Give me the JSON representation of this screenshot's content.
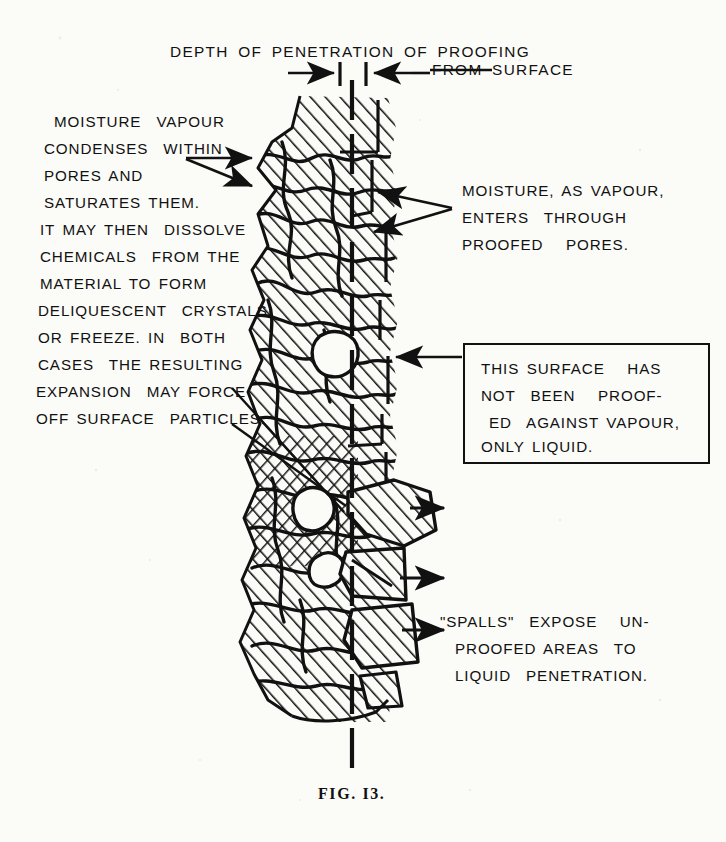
{
  "figure": {
    "caption": "FIG. I3.",
    "title_line1": "DEPTH OF PENETRATION OF PROOFING",
    "title_line2": "FROM SURFACE"
  },
  "annotations": {
    "left_block": {
      "name": "moisture-condensation-note",
      "lines": [
        "MOISTURE  VAPOUR",
        "CONDENSES  WITHIN",
        "PORES AND",
        "SATURATES THEM.",
        "IT MAY THEN  DISSOLVE",
        "CHEMICALS  FROM THE",
        "MATERIAL TO FORM",
        "DELIQUESCENT  CRYSTALS,",
        "OR FREEZE. IN  BOTH",
        "CASES  THE RESULTING",
        "EXPANSION  MAY FORCE",
        "OFF SURFACE  PARTICLES."
      ]
    },
    "vapour_entry": {
      "name": "vapour-entry-note",
      "lines": [
        "MOISTURE, AS VAPOUR,",
        "ENTERS  THROUGH",
        "PROOFED   PORES."
      ]
    },
    "unproofed_box": {
      "name": "unproofed-surface-callout",
      "lines": [
        "THIS SURFACE   HAS",
        "NOT  BEEN   PROOF-",
        "ED  AGAINST VAPOUR,",
        "ONLY LIQUID."
      ]
    },
    "spalls": {
      "name": "spalls-note",
      "lines": [
        "\"SPALLS\"  EXPOSE   UN-",
        "PROOFED AREAS  TO",
        "LIQUID  PENETRATION."
      ]
    }
  },
  "colors": {
    "ink": "#111111",
    "paper": "#fbfbf8"
  },
  "diagram": {
    "name": "material-cross-section"
  }
}
